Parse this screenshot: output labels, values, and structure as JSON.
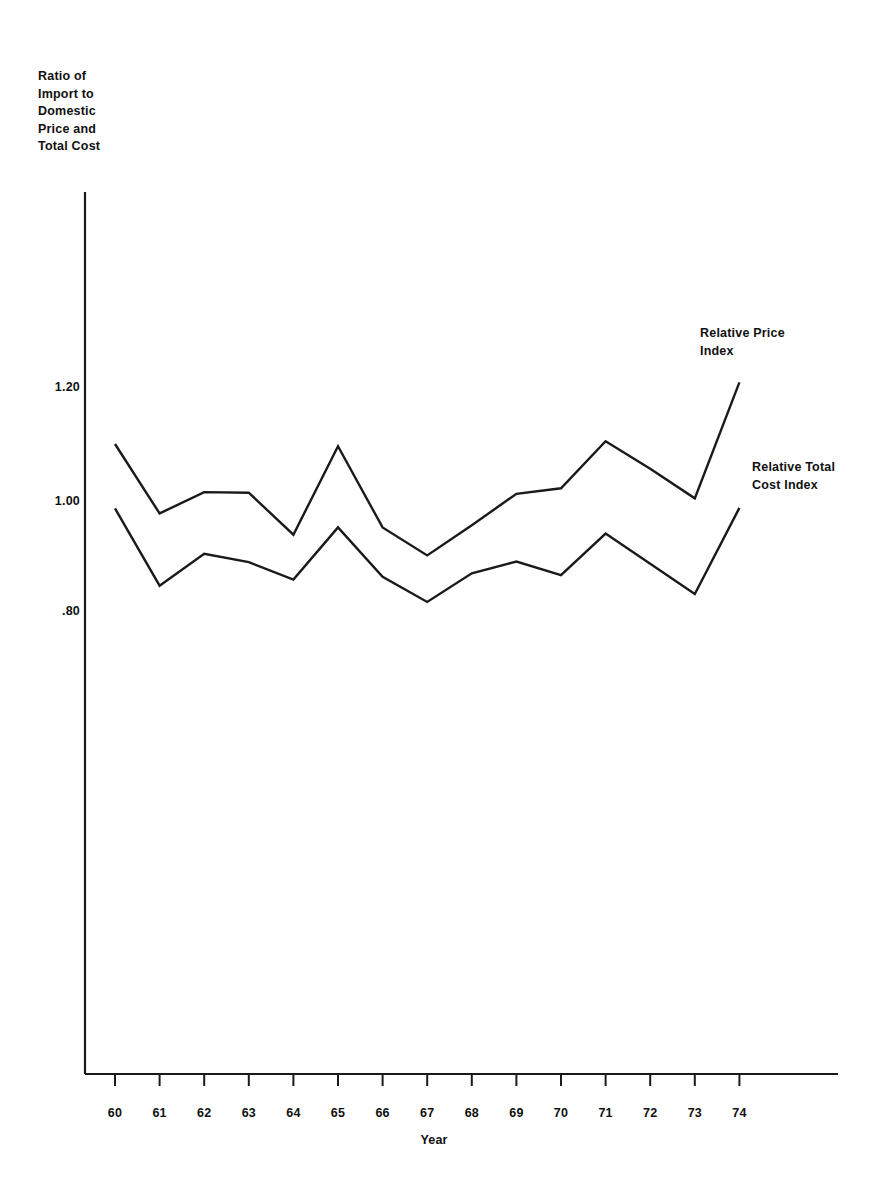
{
  "chart_data": {
    "type": "line",
    "title": "",
    "ylabel": "Ratio of Import to Domestic Price and Total Cost",
    "ylabel_lines": [
      "Ratio of",
      "Import to",
      "Domestic",
      "Price and",
      "Total Cost"
    ],
    "xlabel": "Year",
    "categories": [
      "60",
      "61",
      "62",
      "63",
      "64",
      "65",
      "66",
      "67",
      "68",
      "69",
      "70",
      "71",
      "72",
      "73",
      "74"
    ],
    "x": [
      60,
      61,
      62,
      63,
      64,
      65,
      66,
      67,
      68,
      69,
      70,
      71,
      72,
      73,
      74
    ],
    "yticks": [
      1.2,
      1.0,
      0.8
    ],
    "ytick_labels": [
      "1.20",
      "1.00",
      ".80"
    ],
    "ylim": [
      0.62,
      1.3
    ],
    "grid": false,
    "legend_position": "right-inline",
    "series": [
      {
        "name": "Relative Price Index",
        "label_lines": [
          "Relative Price",
          "Index"
        ],
        "color": "#1a1a1a",
        "values": [
          1.1,
          0.976,
          1.014,
          1.013,
          0.938,
          1.096,
          0.951,
          0.901,
          0.955,
          1.011,
          1.021,
          1.105,
          1.056,
          1.003,
          1.21
        ]
      },
      {
        "name": "Relative Total Cost Index",
        "label_lines": [
          "Relative Total",
          "Cost Index"
        ],
        "color": "#1a1a1a",
        "values": [
          0.985,
          0.847,
          0.904,
          0.889,
          0.858,
          0.951,
          0.863,
          0.818,
          0.869,
          0.89,
          0.866,
          0.94,
          0.886,
          0.832,
          0.986
        ]
      }
    ]
  },
  "axes": {
    "y_axis_name": "value-axis",
    "x_axis_name": "year-axis"
  }
}
